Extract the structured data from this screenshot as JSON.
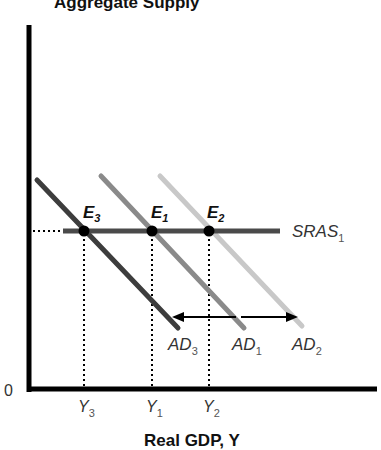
{
  "diagram": {
    "title": "Aggregate Supply",
    "x_axis_label": "Real GDP, Y",
    "origin_label": "0",
    "sras": {
      "name": "SRAS",
      "sub": "1",
      "color": "#4a4a4a"
    },
    "ad_curves": [
      {
        "name": "AD",
        "sub": "3",
        "color": "#3d3d3d"
      },
      {
        "name": "AD",
        "sub": "1",
        "color": "#8a8a8a"
      },
      {
        "name": "AD",
        "sub": "2",
        "color": "#c8c8c8"
      }
    ],
    "equilibria": [
      {
        "name": "E",
        "sub": "3"
      },
      {
        "name": "E",
        "sub": "1"
      },
      {
        "name": "E",
        "sub": "2"
      }
    ],
    "x_ticks": [
      {
        "name": "Y",
        "sub": "3"
      },
      {
        "name": "Y",
        "sub": "1"
      },
      {
        "name": "Y",
        "sub": "2"
      }
    ]
  }
}
